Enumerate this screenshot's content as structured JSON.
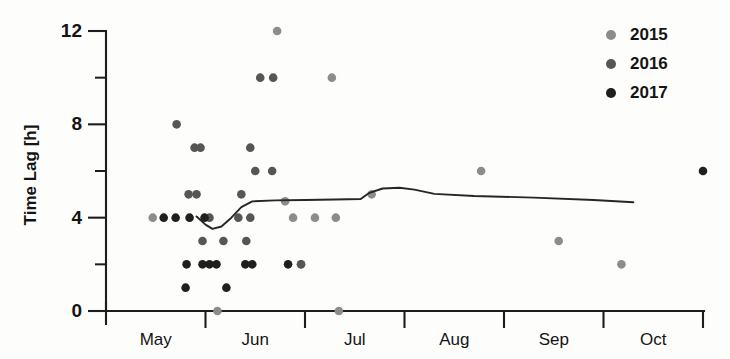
{
  "chart_data": {
    "type": "scatter",
    "title": "",
    "xlabel": "",
    "ylabel": "Time Lag [h]",
    "ylim": [
      0,
      12
    ],
    "y_ticks_major": [
      0,
      4,
      8,
      12
    ],
    "y_ticks_minor": [
      2,
      6,
      10
    ],
    "y_tick_labels": [
      "0",
      "4",
      "8",
      "12"
    ],
    "x_categories": [
      "May",
      "Jun",
      "Jul",
      "Aug",
      "Sep",
      "Oct"
    ],
    "x_range_months": [
      5,
      11
    ],
    "grid": false,
    "legend_position": "top-right",
    "legend": [
      {
        "name": "2015",
        "color": "#8c8c8c"
      },
      {
        "name": "2016",
        "color": "#565656"
      },
      {
        "name": "2017",
        "color": "#1f1f1f"
      }
    ],
    "series": [
      {
        "name": "2015",
        "color": "#8c8c8c",
        "points": [
          {
            "x": 6.72,
            "y": 12.0
          },
          {
            "x": 7.27,
            "y": 10.0
          },
          {
            "x": 7.67,
            "y": 5.0
          },
          {
            "x": 6.8,
            "y": 4.7
          },
          {
            "x": 6.88,
            "y": 4.0
          },
          {
            "x": 7.1,
            "y": 4.0
          },
          {
            "x": 7.31,
            "y": 4.0
          },
          {
            "x": 6.96,
            "y": 2.0
          },
          {
            "x": 8.77,
            "y": 6.0
          },
          {
            "x": 9.55,
            "y": 3.0
          },
          {
            "x": 10.18,
            "y": 2.0
          },
          {
            "x": 5.47,
            "y": 4.0
          },
          {
            "x": 6.12,
            "y": 0.0
          },
          {
            "x": 7.34,
            "y": 0.0
          }
        ]
      },
      {
        "name": "2016",
        "color": "#565656",
        "points": [
          {
            "x": 5.71,
            "y": 8.0
          },
          {
            "x": 5.89,
            "y": 7.0
          },
          {
            "x": 5.95,
            "y": 7.0
          },
          {
            "x": 6.45,
            "y": 7.0
          },
          {
            "x": 6.5,
            "y": 6.0
          },
          {
            "x": 6.67,
            "y": 6.0
          },
          {
            "x": 5.83,
            "y": 5.0
          },
          {
            "x": 5.91,
            "y": 5.0
          },
          {
            "x": 6.36,
            "y": 5.0
          },
          {
            "x": 6.04,
            "y": 4.0
          },
          {
            "x": 6.33,
            "y": 4.0
          },
          {
            "x": 6.45,
            "y": 4.0
          },
          {
            "x": 5.97,
            "y": 3.0
          },
          {
            "x": 6.18,
            "y": 3.0
          },
          {
            "x": 6.41,
            "y": 3.0
          },
          {
            "x": 6.55,
            "y": 10.0
          },
          {
            "x": 6.68,
            "y": 10.0
          },
          {
            "x": 6.96,
            "y": 2.0
          }
        ]
      },
      {
        "name": "2017",
        "color": "#1f1f1f",
        "points": [
          {
            "x": 5.58,
            "y": 4.0
          },
          {
            "x": 5.7,
            "y": 4.0
          },
          {
            "x": 5.84,
            "y": 4.0
          },
          {
            "x": 5.99,
            "y": 4.0
          },
          {
            "x": 5.81,
            "y": 2.0
          },
          {
            "x": 5.97,
            "y": 2.0
          },
          {
            "x": 6.04,
            "y": 2.0
          },
          {
            "x": 6.11,
            "y": 2.0
          },
          {
            "x": 6.4,
            "y": 2.0
          },
          {
            "x": 6.47,
            "y": 2.0
          },
          {
            "x": 5.8,
            "y": 1.0
          },
          {
            "x": 6.21,
            "y": 1.0
          },
          {
            "x": 6.83,
            "y": 2.0
          },
          {
            "x": 11.0,
            "y": 6.0
          }
        ]
      }
    ],
    "trend_line": {
      "name": "trend",
      "color": "#262626",
      "points": [
        {
          "x": 5.91,
          "y": 4.05
        },
        {
          "x": 6.0,
          "y": 3.7
        },
        {
          "x": 6.07,
          "y": 3.52
        },
        {
          "x": 6.16,
          "y": 3.62
        },
        {
          "x": 6.26,
          "y": 4.0
        },
        {
          "x": 6.36,
          "y": 4.45
        },
        {
          "x": 6.47,
          "y": 4.7
        },
        {
          "x": 6.7,
          "y": 4.74
        },
        {
          "x": 7.0,
          "y": 4.76
        },
        {
          "x": 7.3,
          "y": 4.78
        },
        {
          "x": 7.56,
          "y": 4.8
        },
        {
          "x": 7.64,
          "y": 5.05
        },
        {
          "x": 7.78,
          "y": 5.25
        },
        {
          "x": 7.95,
          "y": 5.28
        },
        {
          "x": 8.1,
          "y": 5.2
        },
        {
          "x": 8.3,
          "y": 5.02
        },
        {
          "x": 8.7,
          "y": 4.93
        },
        {
          "x": 9.3,
          "y": 4.86
        },
        {
          "x": 9.9,
          "y": 4.76
        },
        {
          "x": 10.3,
          "y": 4.66
        }
      ]
    }
  },
  "axes": {
    "y_title": "Time Lag [h]",
    "y_labels": [
      "12",
      "8",
      "4",
      "0"
    ],
    "x_labels": [
      "May",
      "Jun",
      "Jul",
      "Aug",
      "Sep",
      "Oct"
    ]
  },
  "legend": {
    "entries": [
      {
        "label": "2015",
        "color": "#8c8c8c"
      },
      {
        "label": "2016",
        "color": "#565656"
      },
      {
        "label": "2017",
        "color": "#1f1f1f"
      }
    ]
  }
}
